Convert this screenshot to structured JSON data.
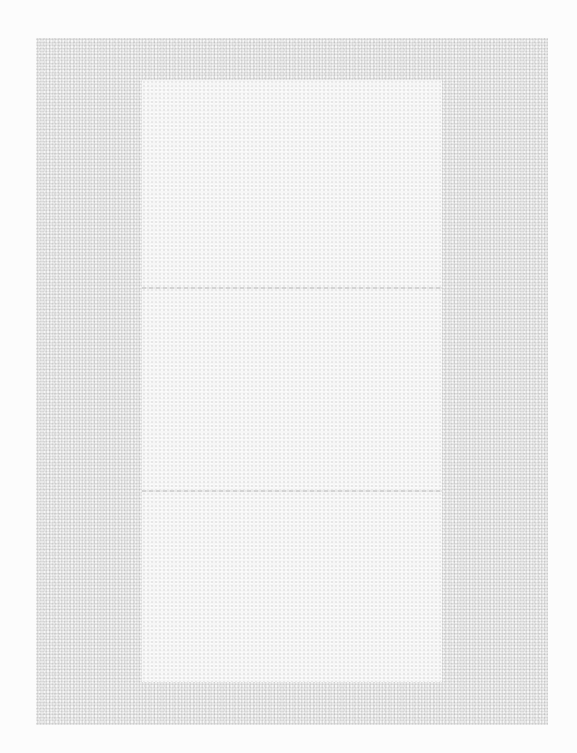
{
  "page": {
    "background_color": "#fcfcfc",
    "field_color": "#e9e9e9",
    "panel_color": "#f6f6f6"
  },
  "panel": {
    "label": "",
    "sections": 3
  }
}
